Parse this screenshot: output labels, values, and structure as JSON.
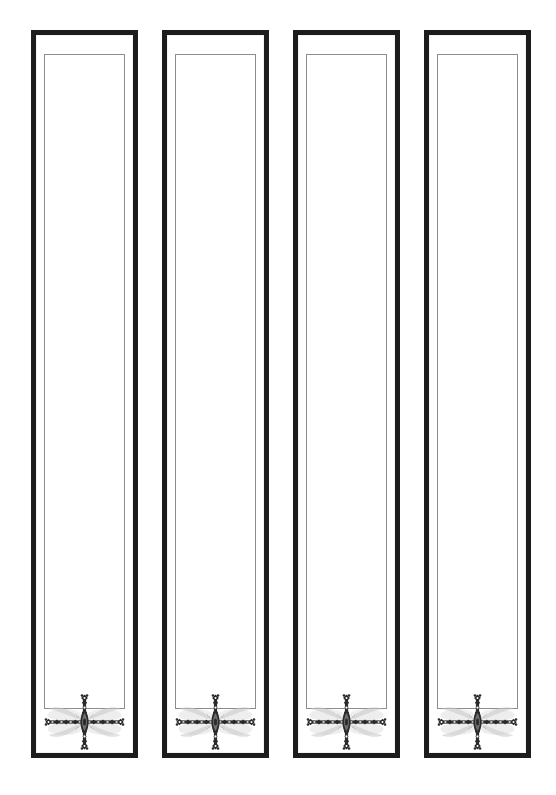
{
  "document": {
    "title": "Decorative Panel Set",
    "description": "Four identical tall rectangular decorative panels in a row, each with a heavy black outer frame, a white field, a thin grey inset rectangle outline, and an ornate beaded cross ornament with pale wing-like shading near the bottom.",
    "background_color": "#ffffff",
    "width": 556,
    "height": 795
  },
  "style": {
    "frame_color": "#1c1c1c",
    "frame_thickness": 5,
    "inset_line_color": "#8d8d8d",
    "inset_line_thickness": 1,
    "field_color": "#ffffff",
    "ornament_dark_color": "#2a2a2a",
    "ornament_mid_color": "#6f6f6f",
    "ornament_shadow_color": "#c9c9c9"
  },
  "panels": [
    {
      "id": "panel-1",
      "label": "Panel 1",
      "x": 31,
      "y": 30,
      "width": 107,
      "height": 728,
      "inset": {
        "x": 13,
        "y": 24,
        "width": 81,
        "height": 655
      },
      "ornament": {
        "name": "ornate-cross-ornament",
        "x": 7,
        "y": 663,
        "width": 93,
        "height": 58
      }
    },
    {
      "id": "panel-2",
      "label": "Panel 2",
      "x": 162,
      "y": 30,
      "width": 107,
      "height": 728,
      "inset": {
        "x": 13,
        "y": 24,
        "width": 81,
        "height": 655
      },
      "ornament": {
        "name": "ornate-cross-ornament",
        "x": 7,
        "y": 663,
        "width": 93,
        "height": 58
      }
    },
    {
      "id": "panel-3",
      "label": "Panel 3",
      "x": 293,
      "y": 30,
      "width": 107,
      "height": 728,
      "inset": {
        "x": 13,
        "y": 24,
        "width": 81,
        "height": 655
      },
      "ornament": {
        "name": "ornate-cross-ornament",
        "x": 7,
        "y": 663,
        "width": 93,
        "height": 58
      }
    },
    {
      "id": "panel-4",
      "label": "Panel 4",
      "x": 424,
      "y": 30,
      "width": 107,
      "height": 728,
      "inset": {
        "x": 13,
        "y": 24,
        "width": 81,
        "height": 655
      },
      "ornament": {
        "name": "ornate-cross-ornament",
        "x": 7,
        "y": 663,
        "width": 93,
        "height": 58
      }
    }
  ]
}
